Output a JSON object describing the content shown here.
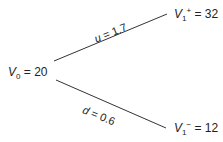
{
  "nodes": {
    "root": {
      "var": "V",
      "sub": "0",
      "sup": "",
      "eq": " = 20",
      "value": 20
    },
    "up": {
      "var": "V",
      "sub": "1",
      "sup": "+",
      "eq": " = 32",
      "value": 32
    },
    "down": {
      "var": "V",
      "sub": "1",
      "sup": "−",
      "eq": " = 12",
      "value": 12
    }
  },
  "edges": {
    "up": {
      "sym": "u",
      "eq": " = 1.7",
      "factor": 1.7
    },
    "down": {
      "sym": "d",
      "eq": " = 0.6",
      "factor": 0.6
    }
  },
  "colors": {
    "line": "#333333",
    "text": "#222222"
  }
}
